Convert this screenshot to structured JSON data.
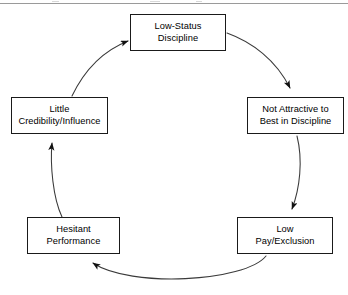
{
  "figure": {
    "type": "cycle-diagram",
    "title": "",
    "divider": "horizontal-rule"
  },
  "nodes": [
    {
      "id": "low-status-discipline",
      "position": "top",
      "line1": "Low-Status",
      "line2": "Discipline"
    },
    {
      "id": "not-attractive",
      "position": "right",
      "line1": "Not Attractive to",
      "line2": "Best in Discipline"
    },
    {
      "id": "low-pay-exclusion",
      "position": "bottom-right",
      "line1": "Low",
      "line2": "Pay/Exclusion"
    },
    {
      "id": "hesitant-performance",
      "position": "bottom-left",
      "line1": "Hesitant",
      "line2": "Performance"
    },
    {
      "id": "little-credibility",
      "position": "left",
      "line1": "Little",
      "line2": "Credibility/Influence"
    }
  ],
  "edges": [
    {
      "id": "edge-top-to-right",
      "from": "low-status-discipline",
      "to": "not-attractive",
      "style": "curved-arrow"
    },
    {
      "id": "edge-right-to-lowpay",
      "from": "not-attractive",
      "to": "low-pay-exclusion",
      "style": "curved-arrow"
    },
    {
      "id": "edge-lowpay-to-hesitant",
      "from": "low-pay-exclusion",
      "to": "hesitant-performance",
      "style": "curved-arrow"
    },
    {
      "id": "edge-hesitant-to-credibility",
      "from": "hesitant-performance",
      "to": "little-credibility",
      "style": "curved-arrow"
    },
    {
      "id": "edge-credibility-to-top",
      "from": "little-credibility",
      "to": "low-status-discipline",
      "style": "curved-arrow"
    }
  ],
  "colors": {
    "stroke": "#1a1a1a",
    "box_fill": "#ffffff",
    "background": "#ffffff",
    "rule": "#9a9a9a"
  }
}
